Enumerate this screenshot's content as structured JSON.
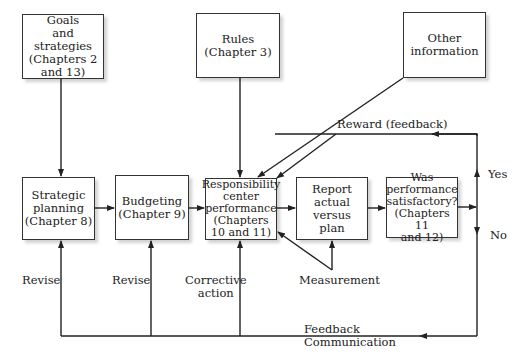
{
  "diagram": {
    "nodes": {
      "goals": "Goals\nand strategies\n(Chapters 2\nand 13)",
      "rules": "Rules\n(Chapter 3)",
      "other": "Other\ninformation",
      "strategic": "Strategic\nplanning\n(Chapter 8)",
      "budgeting": "Budgeting\n(Chapter 9)",
      "responsibility": "Responsibility\ncenter\nperformance\n(Chapters\n10 and 11)",
      "report": "Report\nactual versus\nplan",
      "satisfactory": "Was\nperformance\nsatisfactory?\n(Chapters 11\nand 12)"
    },
    "labels": {
      "reward": "Reward (feedback)",
      "yes": "Yes",
      "no": "No",
      "revise1": "Revise",
      "revise2": "Revise",
      "corrective": "Corrective\naction",
      "measurement": "Measurement",
      "feedback": "Feedback\nCommunication"
    },
    "colors": {
      "line": "#222222",
      "box_border": "#333333"
    }
  }
}
